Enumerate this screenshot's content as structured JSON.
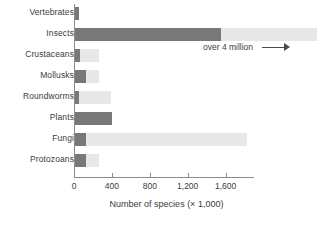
{
  "chart_data": {
    "type": "bar",
    "orientation": "horizontal",
    "title": "",
    "xlabel": "Number of species (× 1,000)",
    "ylabel": "",
    "xlim": [
      0,
      2560
    ],
    "xticks": [
      0,
      400,
      800,
      1200,
      1600
    ],
    "xticklabels": [
      "0",
      "400",
      "800",
      "1,200",
      "1,600"
    ],
    "grid": false,
    "legend": "none",
    "categories": [
      "Vertebrates",
      "Insects",
      "Crustaceans",
      "Mollusks",
      "Roundworms",
      "Plants",
      "Fungi",
      "Protozoans"
    ],
    "series": [
      {
        "name": "known species",
        "color": "#787878",
        "values": [
          50,
          1550,
          60,
          130,
          50,
          400,
          130,
          130
        ]
      },
      {
        "name": "estimated total species",
        "color": "#e7e7e7",
        "values": [
          50,
          2560,
          260,
          260,
          390,
          400,
          1830,
          260
        ]
      }
    ],
    "annotations": [
      {
        "text": "over 4 million",
        "target_category": "Insects",
        "arrow": "right"
      }
    ]
  }
}
